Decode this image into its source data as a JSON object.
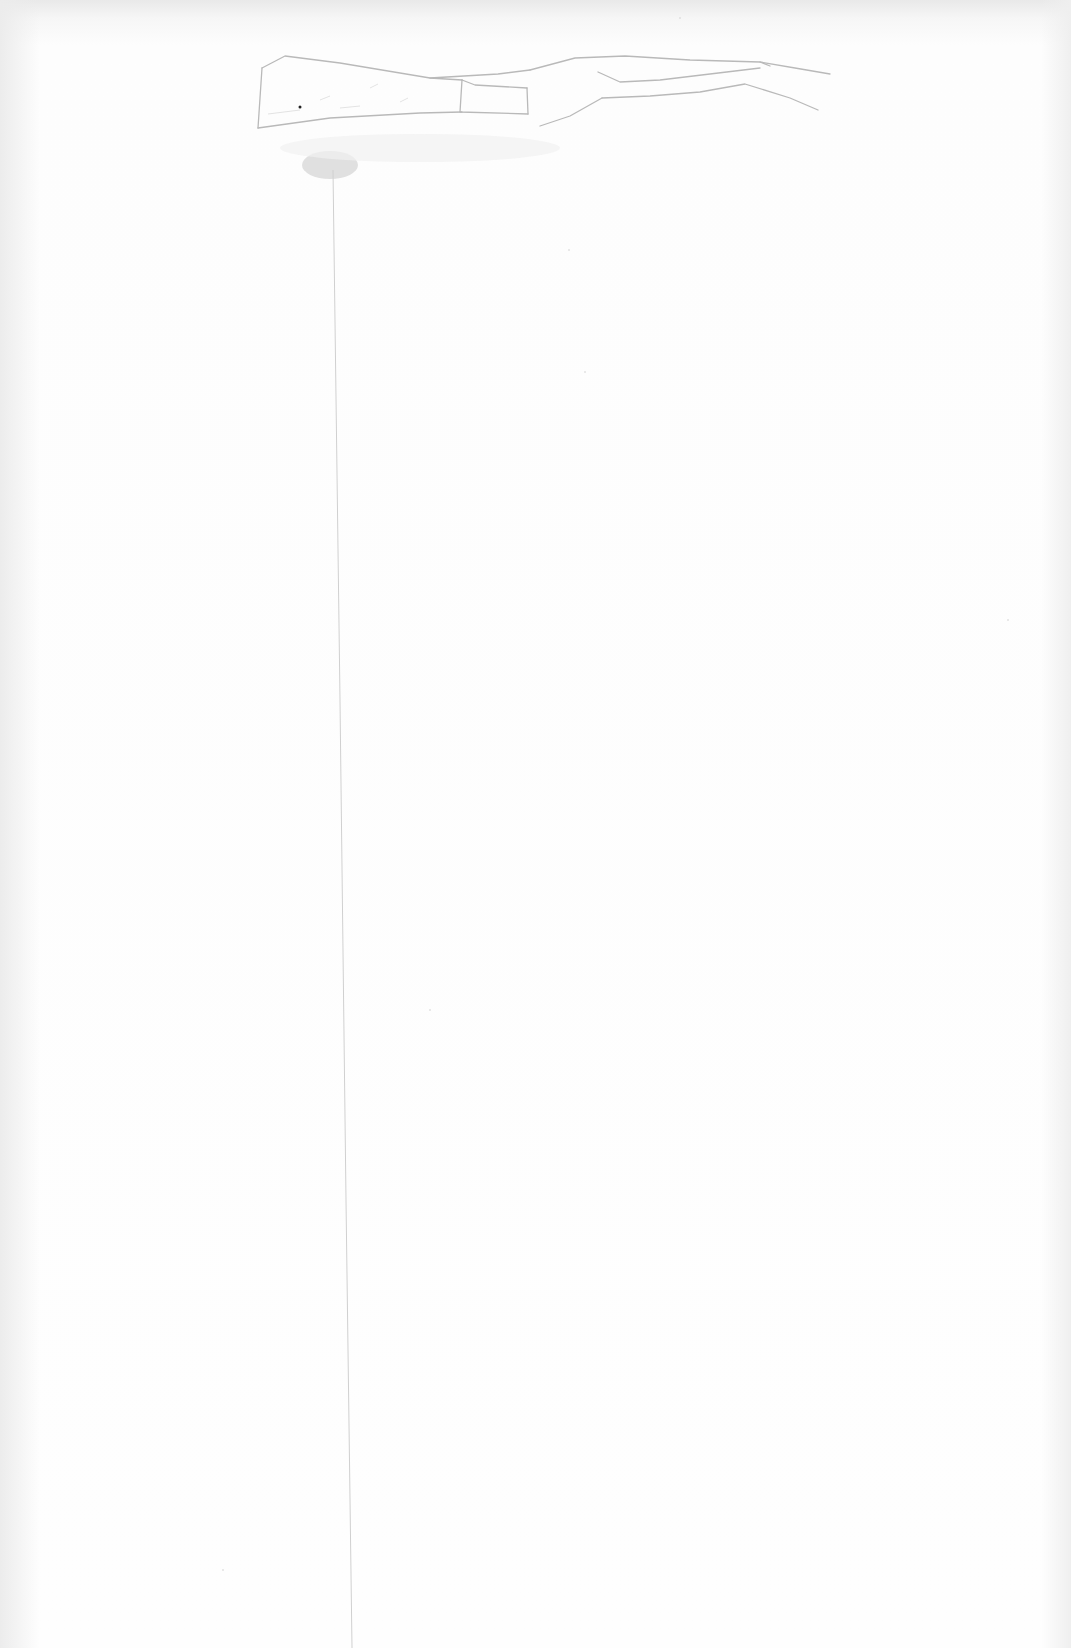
{
  "image": {
    "description": "Scanned sheet of white paper with a faint pencil sketch of a long horizontal stem/branch shape near the top, a gray smudge beneath its left end, and a thin vertical pencil line running down the page",
    "colors": {
      "paper": "#fdfdfd",
      "pencil": "#b8b8b8",
      "smudge": "#d6d6d6",
      "top_edge_shadow": "#e9e9e9"
    }
  }
}
